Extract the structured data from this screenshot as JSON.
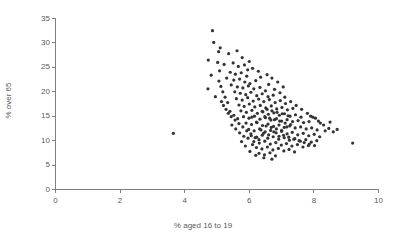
{
  "chart_data": {
    "type": "scatter",
    "title": "",
    "xlabel": "% aged 16 to 19",
    "ylabel": "% over 65",
    "xlim": [
      0,
      10
    ],
    "ylim": [
      0,
      35
    ],
    "xticks": [
      0,
      2,
      4,
      6,
      8,
      10
    ],
    "yticks": [
      0,
      5,
      10,
      15,
      20,
      25,
      30,
      35
    ],
    "xtick_labels": [
      "0",
      "2",
      "4",
      "6",
      "8",
      "10"
    ],
    "ytick_labels": [
      "0",
      "5",
      "10",
      "15",
      "20",
      "25",
      "30",
      "35"
    ],
    "grid": false,
    "legend": null,
    "marker": {
      "shape": "circle",
      "color": "#333333",
      "size_px": 3.2
    },
    "series": [
      {
        "name": "districts",
        "points": [
          [
            4.86,
            32.5
          ],
          [
            4.9,
            30.1
          ],
          [
            5.1,
            29.0
          ],
          [
            5.05,
            28.2
          ],
          [
            5.36,
            27.8
          ],
          [
            4.73,
            26.5
          ],
          [
            5.02,
            26.0
          ],
          [
            5.22,
            25.6
          ],
          [
            5.5,
            25.9
          ],
          [
            5.66,
            25.2
          ],
          [
            5.08,
            24.3
          ],
          [
            5.41,
            24.0
          ],
          [
            5.57,
            23.6
          ],
          [
            5.75,
            23.9
          ],
          [
            5.92,
            23.2
          ],
          [
            5.3,
            22.8
          ],
          [
            5.52,
            22.4
          ],
          [
            5.7,
            22.6
          ],
          [
            5.86,
            22.0
          ],
          [
            6.02,
            21.7
          ],
          [
            6.2,
            22.3
          ],
          [
            5.44,
            21.4
          ],
          [
            5.63,
            21.0
          ],
          [
            5.8,
            20.8
          ],
          [
            5.97,
            21.2
          ],
          [
            6.14,
            20.6
          ],
          [
            6.33,
            20.9
          ],
          [
            6.5,
            20.2
          ],
          [
            5.55,
            20.0
          ],
          [
            5.72,
            19.7
          ],
          [
            5.89,
            19.4
          ],
          [
            6.05,
            19.9
          ],
          [
            6.23,
            19.2
          ],
          [
            6.4,
            19.6
          ],
          [
            6.58,
            19.0
          ],
          [
            6.74,
            19.3
          ],
          [
            5.6,
            18.6
          ],
          [
            5.78,
            18.3
          ],
          [
            5.95,
            18.8
          ],
          [
            6.12,
            18.1
          ],
          [
            6.29,
            18.5
          ],
          [
            6.45,
            18.0
          ],
          [
            6.62,
            18.4
          ],
          [
            6.8,
            17.8
          ],
          [
            6.96,
            18.2
          ],
          [
            7.12,
            17.6
          ],
          [
            5.68,
            17.3
          ],
          [
            5.84,
            17.0
          ],
          [
            6.0,
            17.5
          ],
          [
            6.17,
            16.9
          ],
          [
            6.34,
            17.2
          ],
          [
            6.51,
            16.7
          ],
          [
            6.68,
            17.1
          ],
          [
            6.85,
            16.5
          ],
          [
            7.01,
            16.8
          ],
          [
            7.18,
            16.3
          ],
          [
            7.35,
            16.6
          ],
          [
            5.74,
            16.1
          ],
          [
            5.91,
            15.8
          ],
          [
            6.08,
            16.2
          ],
          [
            6.25,
            15.6
          ],
          [
            6.42,
            15.9
          ],
          [
            6.59,
            15.4
          ],
          [
            6.76,
            15.7
          ],
          [
            6.93,
            15.2
          ],
          [
            7.09,
            15.5
          ],
          [
            7.26,
            15.0
          ],
          [
            7.43,
            15.3
          ],
          [
            7.6,
            14.8
          ],
          [
            5.82,
            14.9
          ],
          [
            5.99,
            14.6
          ],
          [
            6.16,
            15.0
          ],
          [
            6.33,
            14.4
          ],
          [
            6.5,
            14.7
          ],
          [
            6.67,
            14.2
          ],
          [
            6.84,
            14.5
          ],
          [
            7.0,
            14.0
          ],
          [
            7.17,
            14.3
          ],
          [
            7.34,
            13.9
          ],
          [
            7.51,
            14.1
          ],
          [
            7.68,
            13.7
          ],
          [
            7.85,
            13.9
          ],
          [
            5.9,
            13.6
          ],
          [
            6.07,
            13.3
          ],
          [
            6.24,
            13.7
          ],
          [
            6.41,
            13.1
          ],
          [
            6.58,
            13.4
          ],
          [
            6.75,
            12.9
          ],
          [
            6.92,
            13.2
          ],
          [
            7.08,
            12.7
          ],
          [
            7.25,
            13.0
          ],
          [
            7.42,
            12.6
          ],
          [
            7.59,
            12.8
          ],
          [
            7.76,
            12.4
          ],
          [
            7.93,
            12.6
          ],
          [
            8.1,
            12.2
          ],
          [
            5.98,
            12.3
          ],
          [
            6.15,
            12.0
          ],
          [
            6.32,
            12.4
          ],
          [
            6.49,
            11.8
          ],
          [
            6.66,
            12.1
          ],
          [
            6.83,
            11.6
          ],
          [
            7.0,
            11.9
          ],
          [
            7.17,
            11.4
          ],
          [
            7.33,
            11.7
          ],
          [
            7.5,
            11.2
          ],
          [
            7.67,
            11.5
          ],
          [
            7.84,
            11.0
          ],
          [
            8.01,
            11.3
          ],
          [
            8.18,
            10.8
          ],
          [
            6.06,
            11.0
          ],
          [
            6.23,
            10.7
          ],
          [
            6.4,
            11.1
          ],
          [
            6.57,
            10.5
          ],
          [
            6.74,
            10.8
          ],
          [
            6.91,
            10.3
          ],
          [
            7.08,
            10.6
          ],
          [
            7.24,
            10.1
          ],
          [
            7.41,
            10.4
          ],
          [
            7.58,
            9.9
          ],
          [
            7.75,
            10.2
          ],
          [
            7.92,
            9.7
          ],
          [
            8.09,
            10.0
          ],
          [
            6.14,
            9.8
          ],
          [
            6.31,
            9.5
          ],
          [
            6.48,
            9.9
          ],
          [
            6.65,
            9.3
          ],
          [
            6.82,
            9.6
          ],
          [
            6.99,
            9.1
          ],
          [
            7.15,
            9.4
          ],
          [
            7.32,
            8.9
          ],
          [
            7.49,
            9.2
          ],
          [
            7.66,
            8.7
          ],
          [
            7.83,
            9.0
          ],
          [
            6.22,
            8.6
          ],
          [
            6.39,
            8.3
          ],
          [
            6.56,
            8.7
          ],
          [
            6.73,
            8.1
          ],
          [
            6.9,
            8.4
          ],
          [
            7.07,
            7.9
          ],
          [
            7.23,
            8.2
          ],
          [
            7.4,
            7.7
          ],
          [
            6.3,
            7.4
          ],
          [
            6.47,
            7.1
          ],
          [
            6.64,
            7.5
          ],
          [
            6.81,
            6.9
          ],
          [
            5.4,
            16.0
          ],
          [
            5.52,
            15.2
          ],
          [
            5.64,
            14.5
          ],
          [
            5.46,
            13.2
          ],
          [
            5.58,
            12.4
          ],
          [
            5.7,
            11.6
          ],
          [
            5.33,
            17.8
          ],
          [
            5.25,
            18.9
          ],
          [
            5.18,
            20.0
          ],
          [
            5.12,
            21.1
          ],
          [
            5.96,
            10.5
          ],
          [
            6.1,
            9.2
          ],
          [
            5.88,
            8.9
          ],
          [
            6.02,
            7.8
          ],
          [
            6.2,
            7.0
          ],
          [
            6.45,
            6.5
          ],
          [
            6.7,
            6.2
          ],
          [
            5.76,
            9.8
          ],
          [
            5.83,
            10.9
          ],
          [
            6.6,
            21.5
          ],
          [
            6.78,
            20.5
          ],
          [
            6.95,
            19.8
          ],
          [
            7.1,
            18.9
          ],
          [
            7.28,
            18.0
          ],
          [
            7.45,
            17.2
          ],
          [
            7.62,
            16.4
          ],
          [
            7.8,
            15.6
          ],
          [
            7.97,
            14.8
          ],
          [
            8.14,
            14.0
          ],
          [
            8.3,
            13.2
          ],
          [
            8.46,
            12.5
          ],
          [
            8.2,
            13.6
          ],
          [
            8.05,
            14.6
          ],
          [
            7.9,
            15.0
          ],
          [
            6.88,
            22.0
          ],
          [
            7.05,
            21.0
          ],
          [
            6.35,
            23.0
          ],
          [
            6.55,
            23.5
          ],
          [
            6.7,
            22.8
          ],
          [
            5.95,
            24.5
          ],
          [
            6.1,
            24.8
          ],
          [
            6.28,
            24.2
          ],
          [
            5.85,
            25.5
          ],
          [
            6.0,
            26.2
          ],
          [
            5.78,
            27.0
          ],
          [
            5.62,
            28.4
          ],
          [
            6.4,
            16.0
          ],
          [
            6.55,
            16.4
          ],
          [
            6.7,
            16.1
          ],
          [
            6.86,
            15.8
          ],
          [
            7.02,
            15.5
          ],
          [
            7.2,
            15.1
          ],
          [
            6.48,
            14.9
          ],
          [
            6.63,
            14.6
          ],
          [
            6.78,
            14.3
          ],
          [
            6.94,
            14.0
          ],
          [
            7.11,
            13.6
          ],
          [
            7.28,
            13.3
          ],
          [
            6.52,
            13.0
          ],
          [
            6.68,
            12.7
          ],
          [
            6.84,
            12.4
          ],
          [
            7.0,
            12.1
          ],
          [
            7.16,
            12.8
          ],
          [
            6.36,
            12.2
          ],
          [
            6.22,
            13.8
          ],
          [
            6.08,
            14.8
          ],
          [
            6.44,
            11.5
          ],
          [
            6.6,
            11.2
          ],
          [
            6.76,
            11.8
          ],
          [
            6.92,
            10.9
          ],
          [
            7.06,
            11.1
          ],
          [
            7.22,
            10.7
          ],
          [
            7.38,
            10.3
          ],
          [
            7.54,
            10.0
          ],
          [
            7.7,
            9.6
          ],
          [
            7.86,
            9.3
          ],
          [
            8.02,
            9.0
          ],
          [
            6.3,
            10.2
          ],
          [
            6.18,
            10.6
          ],
          [
            6.05,
            11.4
          ],
          [
            5.92,
            12.0
          ],
          [
            5.8,
            12.8
          ],
          [
            5.68,
            13.5
          ],
          [
            5.56,
            14.2
          ],
          [
            5.44,
            14.9
          ],
          [
            5.35,
            15.6
          ],
          [
            5.28,
            16.4
          ],
          [
            5.2,
            17.2
          ],
          [
            5.14,
            18.0
          ],
          [
            3.65,
            11.5
          ],
          [
            9.2,
            9.5
          ],
          [
            4.72,
            20.6
          ],
          [
            4.95,
            19.0
          ],
          [
            5.06,
            22.2
          ],
          [
            4.82,
            23.4
          ],
          [
            8.6,
            11.8
          ],
          [
            8.35,
            12.0
          ],
          [
            8.5,
            13.8
          ],
          [
            8.72,
            12.3
          ]
        ]
      }
    ]
  },
  "axis": {
    "x_title": "% aged 16 to 19",
    "y_title": "% over 65"
  }
}
